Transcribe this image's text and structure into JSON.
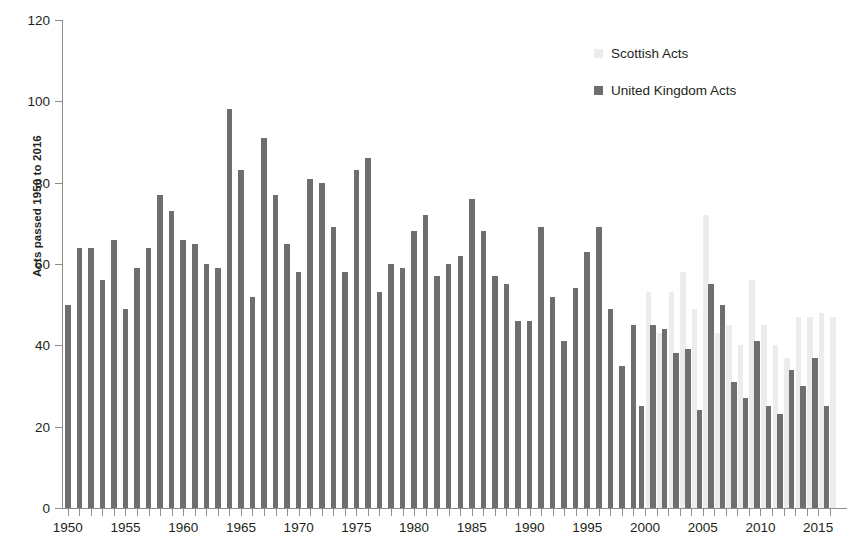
{
  "chart_data": {
    "type": "bar",
    "title": "",
    "subtitle": "",
    "xlabel": "",
    "ylabel": "Acts passed 1950 to 2016",
    "ylim": [
      0,
      120
    ],
    "ytick_step": 20,
    "yticks": [
      0,
      20,
      40,
      60,
      80,
      100,
      120
    ],
    "grid": false,
    "legend_position": "top-right",
    "xtick_labels": [
      "1950",
      "1955",
      "1960",
      "1965",
      "1970",
      "1975",
      "1980",
      "1985",
      "1990",
      "1995",
      "2000",
      "2005",
      "2010",
      "2015"
    ],
    "xtick_years": [
      1950,
      1955,
      1960,
      1965,
      1970,
      1975,
      1980,
      1985,
      1990,
      1995,
      2000,
      2005,
      2010,
      2015
    ],
    "x_range": [
      1950,
      2016
    ],
    "categories": [
      1950,
      1951,
      1952,
      1953,
      1954,
      1955,
      1956,
      1957,
      1958,
      1959,
      1960,
      1961,
      1962,
      1963,
      1964,
      1965,
      1966,
      1967,
      1968,
      1969,
      1970,
      1971,
      1972,
      1973,
      1974,
      1975,
      1976,
      1977,
      1978,
      1979,
      1980,
      1981,
      1982,
      1983,
      1984,
      1985,
      1986,
      1987,
      1988,
      1989,
      1990,
      1991,
      1992,
      1993,
      1994,
      1995,
      1996,
      1997,
      1998,
      1999,
      2000,
      2001,
      2002,
      2003,
      2004,
      2005,
      2006,
      2007,
      2008,
      2009,
      2010,
      2011,
      2012,
      2013,
      2014,
      2015,
      2016
    ],
    "series": [
      {
        "name": "United Kingdom Acts",
        "color": "#6e6e6e",
        "values": [
          50,
          64,
          64,
          56,
          66,
          49,
          59,
          64,
          77,
          73,
          66,
          65,
          60,
          59,
          98,
          83,
          52,
          91,
          77,
          65,
          58,
          81,
          80,
          69,
          58,
          83,
          86,
          53,
          60,
          59,
          68,
          72,
          57,
          60,
          62,
          76,
          68,
          57,
          55,
          46,
          46,
          69,
          52,
          41,
          54,
          63,
          69,
          49,
          35,
          45,
          25,
          45,
          44,
          38,
          39,
          24,
          55,
          50,
          31,
          27,
          41,
          25,
          23,
          34,
          30,
          37,
          25
        ]
      },
      {
        "name": "Scottish Acts",
        "color": "#ececec",
        "values": [
          null,
          null,
          null,
          null,
          null,
          null,
          null,
          null,
          null,
          null,
          null,
          null,
          null,
          null,
          null,
          null,
          null,
          null,
          null,
          null,
          null,
          null,
          null,
          null,
          null,
          null,
          null,
          null,
          null,
          null,
          null,
          null,
          null,
          null,
          null,
          null,
          null,
          null,
          null,
          null,
          null,
          null,
          null,
          null,
          null,
          null,
          null,
          null,
          null,
          null,
          53,
          43,
          53,
          58,
          49,
          72,
          43,
          45,
          40,
          56,
          45,
          40,
          37,
          47,
          47,
          48,
          47
        ]
      }
    ]
  },
  "legend": {
    "items": [
      {
        "label": "Scottish Acts",
        "color": "#ececec"
      },
      {
        "label": "United Kingdom Acts",
        "color": "#6e6e6e"
      }
    ]
  },
  "axes": {
    "y_title": "Acts passed 1950 to 2016"
  }
}
